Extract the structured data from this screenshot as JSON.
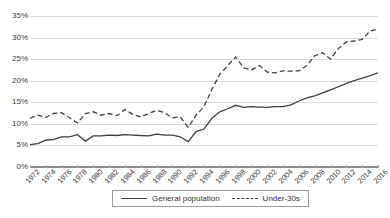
{
  "chart_data": {
    "type": "line",
    "title": "",
    "xlabel": "",
    "ylabel": "",
    "ylim": [
      0,
      35
    ],
    "ytick_labels": [
      "0%",
      "5%",
      "10%",
      "15%",
      "20%",
      "25%",
      "30%",
      "35%"
    ],
    "ytick_values": [
      0,
      5,
      10,
      15,
      20,
      25,
      30,
      35
    ],
    "grid": true,
    "legend_position": "bottom",
    "xlim": [
      1972,
      2016
    ],
    "xtick_labels": [
      "1972",
      "1974",
      "1976",
      "1978",
      "1980",
      "1982",
      "1984",
      "1986",
      "1988",
      "1990",
      "1992",
      "1994",
      "1996",
      "1998",
      "2000",
      "2002",
      "2004",
      "2006",
      "2008",
      "2010",
      "2012",
      "2014",
      "2016"
    ],
    "x": [
      1972,
      1973,
      1974,
      1975,
      1976,
      1977,
      1978,
      1979,
      1980,
      1981,
      1982,
      1983,
      1984,
      1985,
      1986,
      1987,
      1988,
      1989,
      1990,
      1991,
      1992,
      1993,
      1994,
      1995,
      1996,
      1997,
      1998,
      1999,
      2000,
      2001,
      2002,
      2003,
      2004,
      2005,
      2006,
      2007,
      2008,
      2009,
      2010,
      2011,
      2012,
      2013,
      2014,
      2015,
      2016
    ],
    "series": [
      {
        "name": "General population",
        "style": "solid",
        "color": "#404040",
        "values": [
          5.2,
          5.4,
          6.2,
          6.4,
          7.0,
          7.0,
          7.5,
          6.0,
          7.2,
          7.2,
          7.4,
          7.3,
          7.5,
          7.4,
          7.3,
          7.2,
          7.6,
          7.4,
          7.4,
          7.0,
          5.9,
          8.2,
          8.8,
          11.3,
          12.8,
          13.5,
          14.3,
          13.8,
          14.0,
          13.9,
          13.8,
          14.0,
          14.0,
          14.4,
          15.3,
          16.0,
          16.5,
          17.2,
          17.9,
          18.6,
          19.4,
          20.0,
          20.6,
          21.2,
          21.8
        ]
      },
      {
        "name": "Under-30s",
        "style": "dashed",
        "color": "#404040",
        "values": [
          11.3,
          12.0,
          11.5,
          12.4,
          12.6,
          11.4,
          10.2,
          12.4,
          12.8,
          12.0,
          12.4,
          11.9,
          13.3,
          12.2,
          11.6,
          12.4,
          13.1,
          12.6,
          11.4,
          11.6,
          9.2,
          12.0,
          14.0,
          18.0,
          21.5,
          23.5,
          25.5,
          23.0,
          22.5,
          23.5,
          22.0,
          21.8,
          22.3,
          22.2,
          22.3,
          23.5,
          25.8,
          26.5,
          25.0,
          27.5,
          29.0,
          29.2,
          29.6,
          31.5,
          32.0
        ]
      }
    ]
  },
  "legend": {
    "items": [
      {
        "label": "General population",
        "style": "solid"
      },
      {
        "label": "Under-30s",
        "style": "dashed"
      }
    ]
  }
}
